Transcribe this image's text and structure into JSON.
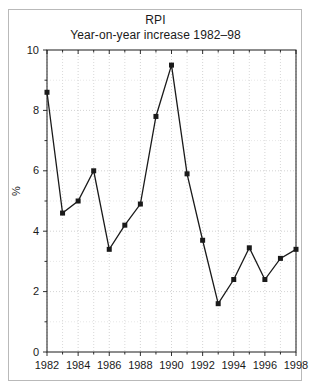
{
  "chart_data": {
    "type": "line",
    "title": "RPI",
    "subtitle": "Year-on-year increase 1982–98",
    "xlabel": "",
    "ylabel": "%",
    "ylim": [
      0,
      10
    ],
    "xlim": [
      1982,
      1998
    ],
    "y_ticks": [
      0,
      2,
      4,
      6,
      8,
      10
    ],
    "y_minor_ticks": [
      1,
      3,
      5,
      7,
      9
    ],
    "x_ticks": [
      1982,
      1984,
      1986,
      1988,
      1990,
      1992,
      1994,
      1996,
      1998
    ],
    "x_minor_ticks": [
      1983,
      1985,
      1987,
      1989,
      1991,
      1993,
      1995,
      1997
    ],
    "grid": true,
    "grid_style": "dotted",
    "legend": null,
    "marker": "square",
    "line_color": "#1a1a1a",
    "marker_color": "#1a1a1a",
    "x": [
      1982,
      1983,
      1984,
      1985,
      1986,
      1987,
      1988,
      1989,
      1990,
      1991,
      1992,
      1993,
      1994,
      1995,
      1996,
      1997,
      1998
    ],
    "values": [
      8.6,
      4.6,
      5.0,
      6.0,
      3.4,
      4.2,
      4.9,
      7.8,
      9.5,
      5.9,
      3.7,
      1.6,
      2.4,
      3.45,
      2.4,
      3.1,
      3.4
    ],
    "y_tick_labels": [
      "0",
      "2",
      "4",
      "6",
      "8",
      "10"
    ],
    "x_tick_labels": [
      "1982",
      "1984",
      "1986",
      "1988",
      "1990",
      "1992",
      "1994",
      "1996",
      "1998"
    ]
  },
  "colors": {
    "axis": "#1a1a1a",
    "grid": "#c8c8c8",
    "frame": "#b9b9b9",
    "background": "#ffffff"
  }
}
